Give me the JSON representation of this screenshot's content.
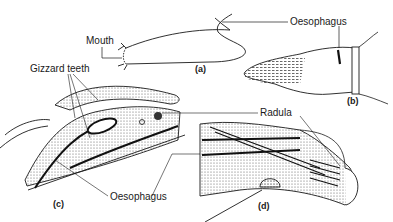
{
  "labels": {
    "mouth": "Mouth",
    "oesophagus_b": "Oesophagus",
    "gizzard_teeth": "Gizzard teeth",
    "radula": "Radula",
    "oesophagus_cd": "Oesophagus"
  },
  "panels": {
    "a": "(a)",
    "b": "(b)",
    "c": "(c)",
    "d": "(d)"
  },
  "colors": {
    "ink": "#1a1a1a",
    "stipple": "#bdbdbd",
    "background": "#ffffff"
  }
}
